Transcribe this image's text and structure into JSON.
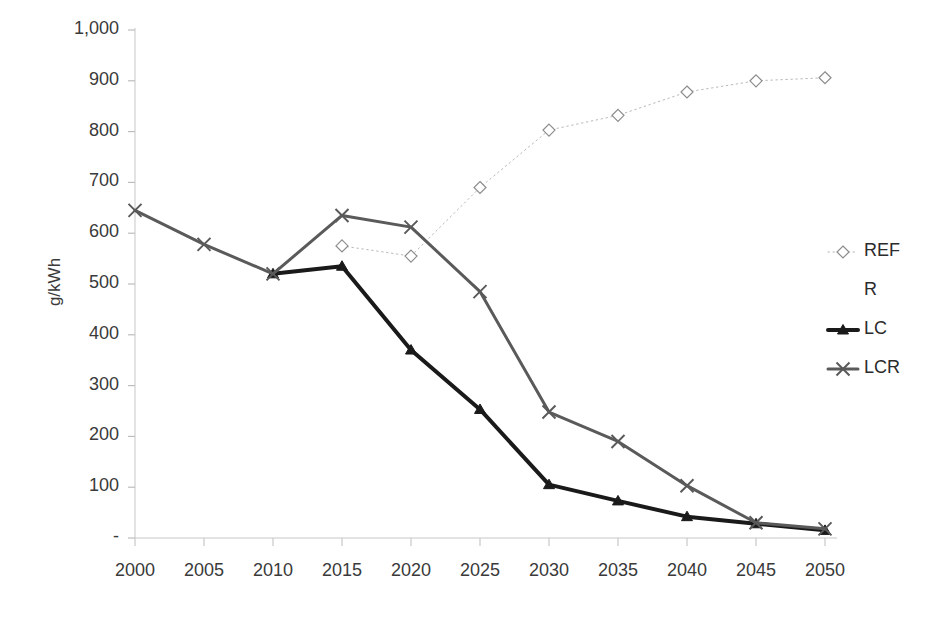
{
  "chart_data": {
    "type": "line",
    "title": "",
    "xlabel": "",
    "ylabel": "g/kWh",
    "x": [
      2000,
      2005,
      2010,
      2015,
      2020,
      2025,
      2030,
      2035,
      2040,
      2045,
      2050
    ],
    "xtick_labels": [
      "2000",
      "2005",
      "2010",
      "2015",
      "2020",
      "2025",
      "2030",
      "2035",
      "2040",
      "2045",
      "2050"
    ],
    "ytick_labels": [
      "1,000",
      "900",
      "800",
      "700",
      "600",
      "500",
      "400",
      "300",
      "200",
      "100",
      "-"
    ],
    "ytick_values": [
      1000,
      900,
      800,
      700,
      600,
      500,
      400,
      300,
      200,
      100,
      0
    ],
    "ylim": [
      0,
      1000
    ],
    "xlim": [
      2000,
      2050
    ],
    "grid": false,
    "legend_position": "right",
    "series": [
      {
        "name": "REF",
        "color": "#b8b8b8",
        "marker": "diamond-open",
        "line_style": "dotted",
        "line_width": 1,
        "x": [
          2015,
          2020,
          2025,
          2030,
          2035,
          2040,
          2045,
          2050
        ],
        "values": [
          575,
          555,
          690,
          803,
          832,
          878,
          900,
          906
        ]
      },
      {
        "name": "R",
        "color": "#ffffff",
        "marker": "none",
        "line_style": "none",
        "line_width": 0,
        "x": [],
        "values": []
      },
      {
        "name": "LC",
        "color": "#1a1a1a",
        "marker": "triangle",
        "line_style": "solid",
        "line_width": 4,
        "x": [
          2010,
          2015,
          2020,
          2025,
          2030,
          2035,
          2040,
          2045,
          2050
        ],
        "values": [
          520,
          535,
          370,
          253,
          105,
          73,
          42,
          28,
          15
        ]
      },
      {
        "name": "LCR",
        "color": "#5a5a5a",
        "marker": "x",
        "line_style": "solid",
        "line_width": 3,
        "x": [
          2000,
          2005,
          2010,
          2015,
          2020,
          2025,
          2030,
          2035,
          2040,
          2045,
          2050
        ],
        "values": [
          645,
          578,
          520,
          635,
          612,
          485,
          248,
          190,
          103,
          30,
          18
        ]
      }
    ],
    "legend_entries": [
      {
        "label": "REF",
        "color": "#b8b8b8",
        "marker": "diamond-open",
        "line_style": "dotted"
      },
      {
        "label": "R",
        "color": "#ffffff",
        "marker": "none",
        "line_style": "none"
      },
      {
        "label": "LC",
        "color": "#1a1a1a",
        "marker": "triangle",
        "line_style": "solid"
      },
      {
        "label": "LCR",
        "color": "#5a5a5a",
        "marker": "x",
        "line_style": "solid"
      }
    ]
  },
  "axis": {
    "y_title": "g/kWh"
  }
}
